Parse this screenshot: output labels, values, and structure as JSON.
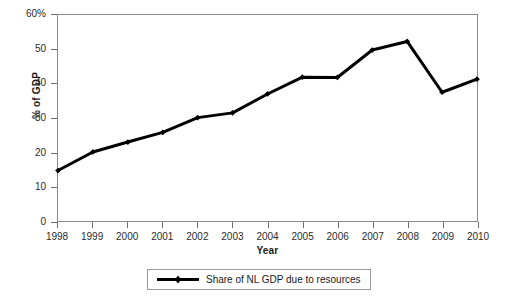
{
  "chart_data": {
    "type": "line",
    "title": "",
    "xlabel": "Year",
    "ylabel": "% of GDP",
    "categories": [
      1998,
      1999,
      2000,
      2001,
      2002,
      2003,
      2004,
      2005,
      2006,
      2007,
      2008,
      2009,
      2010
    ],
    "x": [
      1998,
      1999,
      2000,
      2001,
      2002,
      2003,
      2004,
      2005,
      2006,
      2007,
      2008,
      2009,
      2010
    ],
    "series": [
      {
        "name": "Share of NL GDP due to resources",
        "values": [
          14.7,
          20.1,
          23.0,
          25.8,
          30.1,
          31.5,
          37.0,
          41.9,
          41.8,
          49.8,
          52.3,
          37.5,
          41.3
        ],
        "color": "#000000",
        "marker": "diamond"
      }
    ],
    "xlim": [
      1998,
      2010
    ],
    "ylim": [
      0,
      60
    ],
    "yticks": [
      0,
      10,
      20,
      30,
      40,
      50,
      60
    ],
    "ytick_labels": [
      "0",
      "10",
      "20",
      "30",
      "40",
      "50",
      "60%"
    ],
    "xticks": [
      1998,
      1999,
      2000,
      2001,
      2002,
      2003,
      2004,
      2005,
      2006,
      2007,
      2008,
      2009,
      2010
    ],
    "xtick_labels": [
      "1998",
      "1999",
      "2000",
      "2001",
      "2002",
      "2003",
      "2004",
      "2005",
      "2006",
      "2007",
      "2008",
      "2009",
      "2010"
    ],
    "grid": false,
    "legend_position": "bottom-center",
    "legend_entries": [
      "Share of NL GDP due to resources"
    ]
  },
  "axes": {
    "y_title": "% of GDP",
    "x_title": "Year"
  },
  "legend": {
    "entry_label": "Share of NL GDP due to resources"
  },
  "colors": {
    "series": "#000000",
    "frame": "#8a8a8a",
    "background": "#ffffff",
    "tick": "#6f6f6f"
  }
}
